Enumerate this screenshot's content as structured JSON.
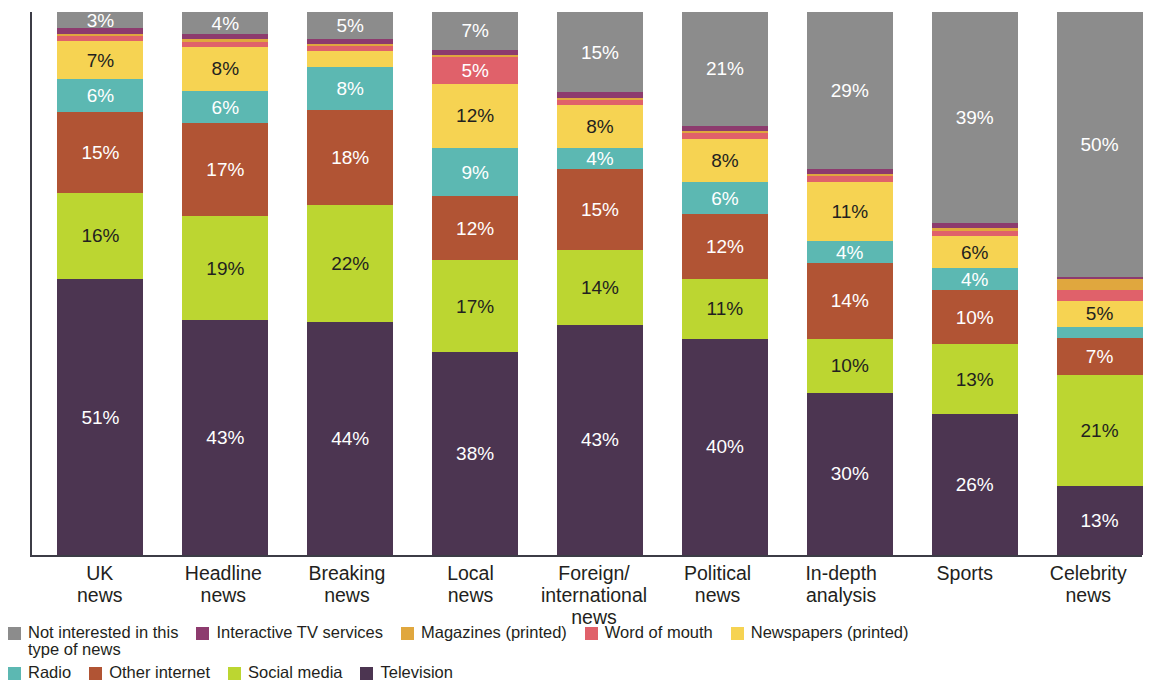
{
  "chart_data": {
    "type": "bar",
    "subtype": "stacked-bar-100",
    "title": "",
    "xlabel": "",
    "ylabel": "",
    "ylim": [
      0,
      100
    ],
    "grid": false,
    "legend_position": "bottom",
    "value_suffix": "%",
    "categories": [
      "UK\nnews",
      "Headline\nnews",
      "Breaking\nnews",
      "Local\nnews",
      "Foreign/\ninternational\nnews",
      "Political\nnews",
      "In-depth\nanalysis",
      "Sports",
      "Celebrity\nnews"
    ],
    "series": [
      {
        "name": "Television",
        "color": "#4c3551",
        "label_color": "#ffffff",
        "values": [
          51,
          43,
          44,
          38,
          43,
          40,
          30,
          26,
          13
        ],
        "labels": [
          "51%",
          "43%",
          "44%",
          "38%",
          "43%",
          "40%",
          "30%",
          "26%",
          "13%"
        ]
      },
      {
        "name": "Social media",
        "color": "#bcd631",
        "label_color": "#231f20",
        "values": [
          16,
          19,
          22,
          17,
          14,
          11,
          10,
          13,
          21
        ],
        "labels": [
          "16%",
          "19%",
          "22%",
          "17%",
          "14%",
          "11%",
          "10%",
          "13%",
          "21%"
        ]
      },
      {
        "name": "Other internet",
        "color": "#b15434",
        "label_color": "#ffffff",
        "values": [
          15,
          17,
          18,
          12,
          15,
          12,
          14,
          10,
          7
        ],
        "labels": [
          "15%",
          "17%",
          "18%",
          "12%",
          "15%",
          "12%",
          "14%",
          "10%",
          "7%"
        ]
      },
      {
        "name": "Radio",
        "color": "#5cb8b2",
        "label_color": "#ffffff",
        "values": [
          6,
          6,
          8,
          9,
          4,
          6,
          4,
          4,
          2
        ],
        "labels": [
          "6%",
          "6%",
          "8%",
          "9%",
          "4%",
          "6%",
          "4%",
          "4%",
          ""
        ]
      },
      {
        "name": "Newspapers (printed)",
        "color": "#f6d352",
        "label_color": "#231f20",
        "values": [
          7,
          8,
          3,
          12,
          8,
          8,
          11,
          6,
          5
        ],
        "labels": [
          "7%",
          "8%",
          "",
          "12%",
          "8%",
          "8%",
          "11%",
          "6%",
          "5%"
        ]
      },
      {
        "name": "Word of mouth",
        "color": "#e0616a",
        "label_color": "#ffffff",
        "values": [
          1,
          1,
          1,
          5,
          1,
          1,
          1,
          1,
          2
        ],
        "labels": [
          "",
          "",
          "",
          "5%",
          "",
          "",
          "",
          "",
          ""
        ]
      },
      {
        "name": "Magazines (printed)",
        "color": "#e0a73e",
        "label_color": "#231f20",
        "values": [
          0.4,
          0.4,
          0.4,
          0.4,
          0.4,
          0.4,
          0.4,
          0.4,
          2
        ],
        "labels": [
          "",
          "",
          "",
          "",
          "",
          "",
          "",
          "",
          ""
        ]
      },
      {
        "name": "Interactive TV services",
        "color": "#8d3b6e",
        "label_color": "#ffffff",
        "values": [
          1,
          1,
          1,
          1,
          1,
          1,
          1,
          1,
          0.4
        ],
        "labels": [
          "",
          "",
          "",
          "",
          "",
          "",
          "",
          "",
          ""
        ]
      },
      {
        "name": "Not interested in this type of news",
        "color": "#8c8c8c",
        "label_color": "#ffffff",
        "values": [
          3,
          4,
          5,
          7,
          15,
          21,
          29,
          39,
          50
        ],
        "labels": [
          "3%",
          "4%",
          "5%",
          "7%",
          "15%",
          "21%",
          "29%",
          "39%",
          "50%"
        ]
      }
    ]
  },
  "legend": {
    "row1": [
      {
        "label": "Not interested in this\ntype of news",
        "color": "#8c8c8c"
      },
      {
        "label": "Interactive TV services",
        "color": "#8d3b6e"
      },
      {
        "label": "Magazines (printed)",
        "color": "#e0a73e"
      },
      {
        "label": "Word of mouth",
        "color": "#e0616a"
      },
      {
        "label": "Newspapers (printed)",
        "color": "#f6d352"
      }
    ],
    "row2": [
      {
        "label": "Radio",
        "color": "#5cb8b2"
      },
      {
        "label": "Other internet",
        "color": "#b15434"
      },
      {
        "label": "Social media",
        "color": "#bcd631"
      },
      {
        "label": "Television",
        "color": "#4c3551"
      }
    ]
  },
  "axis": {
    "line_color": "#3c3c46"
  }
}
